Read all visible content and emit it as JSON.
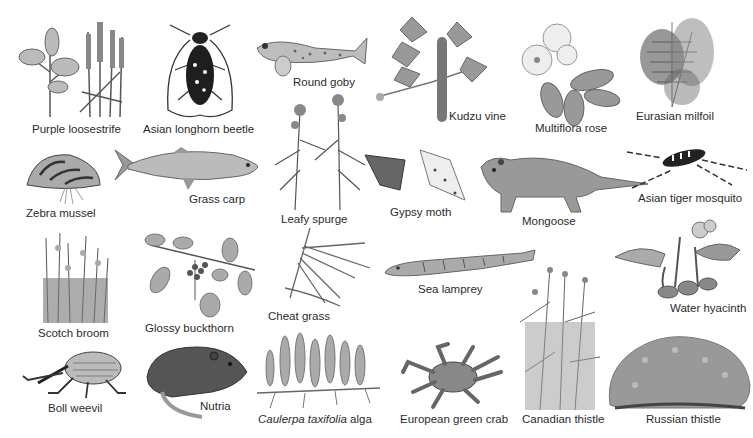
{
  "image": {
    "width": 753,
    "height": 438,
    "style": "grayscale illustration plate",
    "background": "#ffffff",
    "ink_color": "#2b2b2b"
  },
  "specimens": [
    {
      "id": "purple-loosestrife",
      "label": "Purple loosestrife",
      "kind": "plant",
      "label_pos": [
        32,
        123
      ]
    },
    {
      "id": "asian-longhorn-beetle",
      "label": "Asian longhorn beetle",
      "kind": "insect",
      "label_pos": [
        143,
        123
      ]
    },
    {
      "id": "round-goby",
      "label": "Round goby",
      "kind": "fish",
      "label_pos": [
        293,
        76
      ]
    },
    {
      "id": "kudzu-vine",
      "label": "Kudzu vine",
      "kind": "plant",
      "label_pos": [
        449,
        110
      ]
    },
    {
      "id": "multiflora-rose",
      "label": "Multiflora rose",
      "kind": "plant",
      "label_pos": [
        535,
        122
      ]
    },
    {
      "id": "eurasian-milfoil",
      "label": "Eurasian milfoil",
      "kind": "plant",
      "label_pos": [
        636,
        110
      ]
    },
    {
      "id": "zebra-mussel",
      "label": "Zebra mussel",
      "kind": "mollusk",
      "label_pos": [
        26,
        207
      ]
    },
    {
      "id": "grass-carp",
      "label": "Grass carp",
      "kind": "fish",
      "label_pos": [
        189,
        193
      ]
    },
    {
      "id": "leafy-spurge",
      "label": "Leafy spurge",
      "kind": "plant",
      "label_pos": [
        281,
        213
      ]
    },
    {
      "id": "gypsy-moth",
      "label": "Gypsy moth",
      "kind": "insect",
      "label_pos": [
        390,
        206
      ]
    },
    {
      "id": "mongoose",
      "label": "Mongoose",
      "kind": "mammal",
      "label_pos": [
        522,
        215
      ]
    },
    {
      "id": "asian-tiger-mosquito",
      "label": "Asian tiger mosquito",
      "kind": "insect",
      "label_pos": [
        638,
        192
      ]
    },
    {
      "id": "scotch-broom",
      "label": "Scotch broom",
      "kind": "plant",
      "label_pos": [
        38,
        327
      ]
    },
    {
      "id": "glossy-buckthorn",
      "label": "Glossy buckthorn",
      "kind": "plant",
      "label_pos": [
        145,
        322
      ]
    },
    {
      "id": "cheat-grass",
      "label": "Cheat grass",
      "kind": "plant",
      "label_pos": [
        268,
        310
      ]
    },
    {
      "id": "sea-lamprey",
      "label": "Sea lamprey",
      "kind": "fish",
      "label_pos": [
        418,
        283
      ]
    },
    {
      "id": "water-hyacinth",
      "label": "Water hyacinth",
      "kind": "plant",
      "label_pos": [
        670,
        302
      ]
    },
    {
      "id": "boll-weevil",
      "label": "Boll weevil",
      "kind": "insect",
      "label_pos": [
        48,
        402
      ]
    },
    {
      "id": "nutria",
      "label": "Nutria",
      "kind": "mammal",
      "label_pos": [
        200,
        400
      ]
    },
    {
      "id": "caulerpa-taxifolia",
      "label": "Caulerpa taxifolia alga",
      "label_italic": "Caulerpa taxifolia",
      "label_rest": " alga",
      "kind": "alga",
      "label_pos": [
        258,
        413
      ]
    },
    {
      "id": "european-green-crab",
      "label": "European green crab",
      "kind": "crustacean",
      "label_pos": [
        400,
        413
      ]
    },
    {
      "id": "canadian-thistle",
      "label": "Canadian thistle",
      "kind": "plant",
      "label_pos": [
        522,
        413
      ]
    },
    {
      "id": "russian-thistle",
      "label": "Russian thistle",
      "kind": "plant",
      "label_pos": [
        646,
        413
      ]
    }
  ],
  "labels": {
    "purple_loosestrife": "Purple loosestrife",
    "asian_longhorn_beetle": "Asian longhorn beetle",
    "round_goby": "Round goby",
    "kudzu_vine": "Kudzu vine",
    "multiflora_rose": "Multiflora rose",
    "eurasian_milfoil": "Eurasian milfoil",
    "zebra_mussel": "Zebra mussel",
    "grass_carp": "Grass carp",
    "leafy_spurge": "Leafy spurge",
    "gypsy_moth": "Gypsy moth",
    "mongoose": "Mongoose",
    "asian_tiger_mosquito": "Asian tiger mosquito",
    "scotch_broom": "Scotch broom",
    "glossy_buckthorn": "Glossy buckthorn",
    "cheat_grass": "Cheat grass",
    "sea_lamprey": "Sea lamprey",
    "water_hyacinth": "Water hyacinth",
    "boll_weevil": "Boll weevil",
    "nutria": "Nutria",
    "caulerpa_italic": "Caulerpa taxifolia",
    "caulerpa_rest": " alga",
    "european_green_crab": "European green crab",
    "canadian_thistle": "Canadian thistle",
    "russian_thistle": "Russian thistle"
  }
}
